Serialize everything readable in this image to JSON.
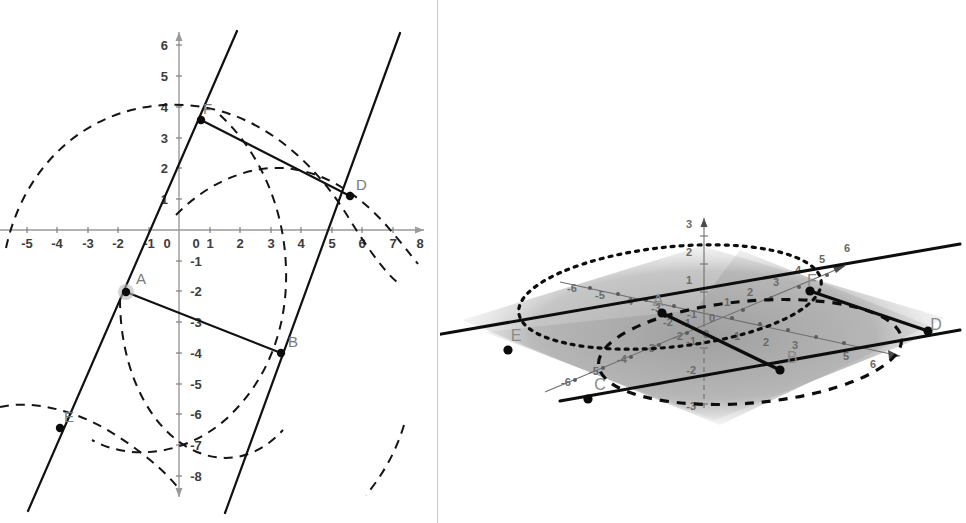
{
  "figure": {
    "background_color": "#ffffff",
    "divider_color": "#c9c9c9"
  },
  "panel_2d": {
    "name": "Graphics view (2D)",
    "x_axis": {
      "label_values": [
        "-5",
        "-4",
        "-3",
        "-2",
        "-1",
        "0",
        "1",
        "2",
        "3",
        "4",
        "5",
        "6",
        "7",
        "8"
      ],
      "range": [
        -5.6,
        8.4
      ],
      "arrow": "right"
    },
    "y_axis": {
      "label_values": [
        "6",
        "5",
        "4",
        "3",
        "2",
        "1",
        "0",
        "-1",
        "-2",
        "-3",
        "-4",
        "-5",
        "-6",
        "-7",
        "-8"
      ],
      "range": [
        -8.5,
        6.4
      ],
      "arrow": "up"
    },
    "points": [
      {
        "label": "A",
        "x": -2.0,
        "y": -2.0,
        "halo": true
      },
      {
        "label": "B",
        "x": 3.4,
        "y": -4.0,
        "halo": false
      },
      {
        "label": "D",
        "x": 5.6,
        "y": 1.1,
        "halo": false
      },
      {
        "label": "E",
        "x": -4.0,
        "y": -6.8,
        "halo": false
      },
      {
        "label": "F",
        "x": 0.75,
        "y": 3.55,
        "halo": false
      }
    ],
    "lines": [
      {
        "name": "line-AF",
        "through": [
          "A",
          "F"
        ],
        "style": "solid"
      },
      {
        "name": "line-BD",
        "through": [
          "B",
          "D"
        ],
        "style": "solid"
      },
      {
        "name": "segment-FD",
        "through": [
          "F",
          "D"
        ],
        "style": "solid"
      },
      {
        "name": "segment-AB",
        "through": [
          "A",
          "B"
        ],
        "style": "solid"
      }
    ],
    "dashed_curves_count": 3,
    "accent_color": "#111111",
    "axis_color": "#9a9a9a"
  },
  "panel_3d": {
    "name": "3D Graphics view",
    "x_axis": {
      "label_values": [
        "-6",
        "-5",
        "-4",
        "-3",
        "-2",
        "-1",
        "0",
        "1",
        "2",
        "3",
        "5",
        "6"
      ],
      "arrow": "right-down"
    },
    "y_axis": {
      "label_values": [
        "-6",
        "-5",
        "-4",
        "-3",
        "-2",
        "-1",
        "1",
        "2",
        "3",
        "4",
        "5",
        "6"
      ],
      "arrow": "up-right"
    },
    "z_axis": {
      "label_values": [
        "3",
        "2",
        "1",
        "0",
        "-1",
        "-2",
        "-3"
      ],
      "arrow": "up"
    },
    "points": [
      {
        "label": "A"
      },
      {
        "label": "B"
      },
      {
        "label": "C"
      },
      {
        "label": "D"
      },
      {
        "label": "E"
      },
      {
        "label": "F"
      }
    ],
    "plane_fill": "#b3b3b3",
    "ellipse_count": 2,
    "accent_color": "#0d0d0d"
  }
}
